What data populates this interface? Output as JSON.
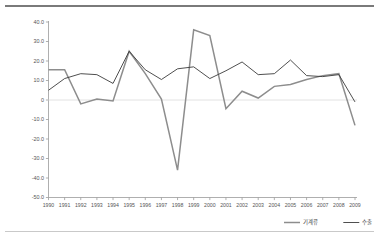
{
  "chart_data": {
    "type": "line",
    "title": "",
    "subtitle": "",
    "xlabel": "",
    "ylabel": "",
    "grid": false,
    "zero_line": true,
    "legend_position": "bottom-right",
    "x": [
      1990,
      1991,
      1992,
      1993,
      1994,
      1995,
      1996,
      1997,
      1998,
      1999,
      2000,
      2001,
      2002,
      2003,
      2004,
      2005,
      2006,
      2007,
      2008,
      2009
    ],
    "categories": [
      "1990",
      "1991",
      "1992",
      "1993",
      "1994",
      "1995",
      "1996",
      "1997",
      "1998",
      "1999",
      "2000",
      "2001",
      "2002",
      "2003",
      "2004",
      "2005",
      "2006",
      "2007",
      "2008",
      "2009"
    ],
    "xlim": [
      1990,
      2009
    ],
    "ylim": [
      -50.0,
      40.0
    ],
    "ytick_labels": [
      "40.0",
      "30.0",
      "20.0",
      "10.0",
      "0",
      "-10.0",
      "-20.0",
      "-30.0",
      "-40.0",
      "-50.0"
    ],
    "ytick_values": [
      40.0,
      30.0,
      20.0,
      10.0,
      0.0,
      -10.0,
      -20.0,
      -30.0,
      -40.0,
      -50.0
    ],
    "series": [
      {
        "name": "기계류",
        "color": "#8d8d8d",
        "values": [
          15.5,
          15.5,
          -2.0,
          0.5,
          -0.5,
          25.0,
          13.5,
          0.5,
          -36.0,
          36.0,
          33.0,
          -4.5,
          4.5,
          1.0,
          7.0,
          8.0,
          10.5,
          12.5,
          13.5,
          -13.0
        ]
      },
      {
        "name": "수출",
        "color": "#3b3b3b",
        "values": [
          5.0,
          11.0,
          13.5,
          13.0,
          8.5,
          25.0,
          15.5,
          10.5,
          16.0,
          17.0,
          11.0,
          15.0,
          19.5,
          13.0,
          13.5,
          20.5,
          12.5,
          12.0,
          13.0,
          -1.0
        ]
      }
    ],
    "legend": [
      {
        "label": "기계류",
        "color": "#8d8d8d"
      },
      {
        "label": "수출",
        "color": "#3b3b3b"
      }
    ]
  },
  "frame": {
    "top_rule_color": "#7a7a7a",
    "bottom_rule_color": "#c9c9c9"
  }
}
